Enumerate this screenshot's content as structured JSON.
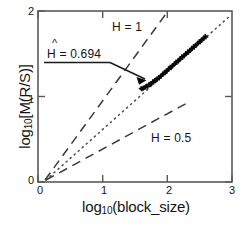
{
  "chart_data": {
    "type": "scatter",
    "title": "",
    "xlabel": "log10(block_size)",
    "ylabel": "log10[M(R/S)]",
    "xlim": [
      0,
      3
    ],
    "ylim": [
      0,
      2
    ],
    "xticks": [
      "0",
      "1",
      "2",
      "3"
    ],
    "yticks": [
      "0",
      "1",
      "2"
    ],
    "grid": false,
    "legend_position": "inline-annotations",
    "series": [
      {
        "name": "R/S statistic (pox plot)",
        "marker": "plus",
        "style": "scatter",
        "x": [
          1.6,
          1.63,
          1.66,
          1.69,
          1.72,
          1.75,
          1.78,
          1.81,
          1.84,
          1.87,
          1.9,
          1.93,
          1.96,
          1.99,
          2.02,
          2.05,
          2.08,
          2.11,
          2.14,
          2.17,
          2.2,
          2.23,
          2.26,
          2.29,
          2.32,
          2.35,
          2.38,
          2.41,
          2.44,
          2.47,
          2.5,
          2.53,
          2.56,
          2.59
        ],
        "y": [
          1.09,
          1.1,
          1.11,
          1.12,
          1.14,
          1.15,
          1.17,
          1.19,
          1.2,
          1.22,
          1.24,
          1.26,
          1.28,
          1.3,
          1.32,
          1.34,
          1.36,
          1.38,
          1.4,
          1.42,
          1.44,
          1.46,
          1.48,
          1.5,
          1.52,
          1.54,
          1.56,
          1.58,
          1.6,
          1.62,
          1.64,
          1.66,
          1.68,
          1.7
        ]
      },
      {
        "name": "H = 1 reference line",
        "style": "dashed",
        "slope": 1.0,
        "intercept": -0.12,
        "x": [
          0.12,
          1.98
        ],
        "y": [
          0.0,
          2.0
        ]
      },
      {
        "name": "fitted line H-hat = 0.694",
        "style": "dotted",
        "slope": 0.694,
        "intercept": -0.13,
        "x": [
          0.19,
          3.0
        ],
        "y": [
          0.0,
          1.95
        ]
      },
      {
        "name": "H = 0.5 reference line",
        "style": "dashed",
        "slope": 0.5,
        "intercept": -0.1,
        "x": [
          0.2,
          2.3
        ],
        "y": [
          0.0,
          1.05
        ]
      }
    ],
    "annotations": [
      {
        "name": "h-hat-estimate",
        "text": "H = 0.694",
        "accent": "^",
        "full_text": "Ĥ = 0.694",
        "points_to": [
          1.6,
          1.09
        ],
        "has_underline": true,
        "has_arrow": true
      },
      {
        "name": "h-one-label",
        "text": "H = 1"
      },
      {
        "name": "h-half-label",
        "text": "H = 0.5"
      }
    ],
    "colors": {
      "axis": "#4d4d4d",
      "data": "#0a0a0a",
      "reference_line": "#3a3a3a",
      "fit_line": "#4a4a4a",
      "text": "#141414",
      "background": "#ffffff"
    }
  },
  "axes": {
    "x_title_main": "log",
    "x_title_sub": "10",
    "x_title_rest": "(block_size)",
    "y_title_main": "log",
    "y_title_sub": "10",
    "y_title_rest": "[M(R/S)]",
    "xticks": {
      "t0": "0",
      "t1": "1",
      "t2": "2",
      "t3": "3"
    },
    "yticks": {
      "t0": "0",
      "t1": "1",
      "t2": "2"
    }
  },
  "labels": {
    "h_one": "H = 1",
    "h_half": "H = 0.5",
    "h_hat_caret": "^",
    "h_hat_text": "H = 0.694"
  }
}
